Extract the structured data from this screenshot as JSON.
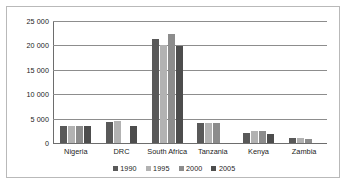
{
  "chart_data": {
    "type": "bar",
    "title": "",
    "xlabel": "",
    "ylabel": "",
    "ylim": [
      0,
      25000
    ],
    "grid": true,
    "legend_position": "bottom-center",
    "categories": [
      "Nigeria",
      "DRC",
      "South Africa",
      "Tanzania",
      "Kenya",
      "Zambia"
    ],
    "y_ticks": [
      {
        "value": 0,
        "label": "0"
      },
      {
        "value": 5000,
        "label": "5 000"
      },
      {
        "value": 10000,
        "label": "10 000"
      },
      {
        "value": 15000,
        "label": "15 000"
      },
      {
        "value": 20000,
        "label": "20 000"
      },
      {
        "value": 25000,
        "label": "25 000"
      }
    ],
    "series": [
      {
        "name": "1990",
        "color": "#595959",
        "values": [
          3400,
          4400,
          21400,
          4100,
          2100,
          1000
        ]
      },
      {
        "name": "1995",
        "color": "#b2b2b2",
        "values": [
          3400,
          4600,
          20000,
          4100,
          2500,
          950
        ]
      },
      {
        "name": "2000",
        "color": "#8c8c8c",
        "values": [
          3400,
          0,
          22400,
          4200,
          2400,
          900
        ]
      },
      {
        "name": "2005",
        "color": "#4d4d4d",
        "values": [
          3400,
          3400,
          19800,
          0,
          1900,
          0
        ]
      }
    ]
  }
}
